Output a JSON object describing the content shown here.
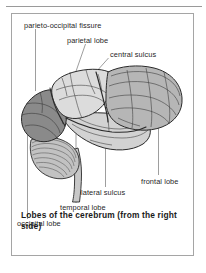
{
  "figure": {
    "caption_line1": "Lobes of the cerebrum (from the",
    "caption_line2": "right side)",
    "caption_full": "Lobes of the cerebrum (from the right side)",
    "labels": {
      "parieto_occipital_fissure": "parieto-occipital fissure",
      "parietal_lobe": "parietal lobe",
      "central_sulcus": "central sulcus",
      "frontal_lobe": "frontal lobe",
      "lateral_sulcus": "lateral sulcus",
      "temporal_lobe": "temporal lobe",
      "occipital_lobe": "occipital lobe"
    },
    "colors": {
      "occipital_fill": "#8a8a8a",
      "parietal_fill": "#dcdcdc",
      "temporal_fill": "#d2d2d2",
      "frontal_fill": "#b6b6b6",
      "cerebellum_fill": "#c2c2c2",
      "brainstem_fill": "#c8c8c8",
      "outline": "#2a2a2a",
      "leader_line": "#8d8d8d",
      "frame_border": "#a5a5a5",
      "text": "#1f1f1f",
      "background": "#ffffff"
    }
  }
}
